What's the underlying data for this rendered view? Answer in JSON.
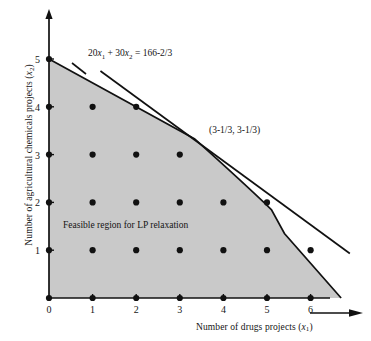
{
  "figure": {
    "type": "lp-feasible-region-plot",
    "background_color": "#ffffff",
    "shade_color": "#c9c9c9",
    "line_color": "#111111"
  },
  "axes": {
    "x": {
      "label_text": "Number of drugs projects (",
      "label_var": "x",
      "label_sub": "1",
      "label_close": ")",
      "ticks": [
        "0",
        "1",
        "2",
        "3",
        "4",
        "5",
        "6"
      ],
      "arrow": "right-arrow-icon"
    },
    "y": {
      "label_text": "Number of agricultural chemicals projects (",
      "label_var": "x",
      "label_sub": "2",
      "label_close": ")",
      "ticks": [
        "0",
        "1",
        "2",
        "3",
        "4",
        "5"
      ],
      "arrow": "up-arrow-icon"
    }
  },
  "annotations": {
    "constraint_label": {
      "prefix": "20",
      "var1": "x",
      "sub1": "1",
      "mid": " + 30",
      "var2": "x",
      "sub2": "2",
      "suffix": " = 166-2/3"
    },
    "vertex_label": "(3-1/3, 3-1/3)",
    "region_label": "Feasible region for LP relaxation"
  },
  "chart_data": {
    "type": "scatter",
    "title": "",
    "xlabel": "Number of drugs projects (x1)",
    "ylabel": "Number of agricultural chemicals projects (x2)",
    "xlim": [
      0,
      6.9
    ],
    "ylim": [
      0,
      5.6
    ],
    "xticks": [
      0,
      1,
      2,
      3,
      4,
      5,
      6
    ],
    "yticks": [
      0,
      1,
      2,
      3,
      4,
      5
    ],
    "grid": false,
    "legend": "none",
    "series": [
      {
        "name": "Integer lattice points in feasible region",
        "marker": "filled-circle",
        "points": [
          [
            0,
            0
          ],
          [
            1,
            0
          ],
          [
            2,
            0
          ],
          [
            3,
            0
          ],
          [
            4,
            0
          ],
          [
            5,
            0
          ],
          [
            6,
            0
          ],
          [
            0,
            1
          ],
          [
            1,
            1
          ],
          [
            2,
            1
          ],
          [
            3,
            1
          ],
          [
            4,
            1
          ],
          [
            5,
            1
          ],
          [
            6,
            1
          ],
          [
            0,
            2
          ],
          [
            1,
            2
          ],
          [
            2,
            2
          ],
          [
            3,
            2
          ],
          [
            4,
            2
          ],
          [
            5,
            2
          ],
          [
            0,
            3
          ],
          [
            1,
            3
          ],
          [
            2,
            3
          ],
          [
            3,
            3
          ],
          [
            0,
            4
          ],
          [
            1,
            4
          ],
          [
            2,
            4
          ],
          [
            0,
            5
          ]
        ]
      }
    ],
    "shaded_region": {
      "name": "Feasible region for LP relaxation",
      "fill": "#c9c9c9",
      "vertices": [
        [
          0,
          0
        ],
        [
          0,
          5
        ],
        [
          3.3333,
          3.3333
        ],
        [
          5.1,
          1.85
        ],
        [
          5.4,
          1.35
        ],
        [
          6.7,
          0
        ]
      ]
    },
    "lines": [
      {
        "name": "20x1 + 30x2 = 166-2/3",
        "equation": "20*x1 + 30*x2 = 166.6667",
        "endpoints": [
          [
            1.18,
            4.75
          ],
          [
            6.9,
            0.93
          ]
        ],
        "style": "solid"
      }
    ],
    "labeled_points": [
      {
        "label": "(3-1/3, 3-1/3)",
        "x": 3.3333,
        "y": 3.3333
      }
    ]
  }
}
